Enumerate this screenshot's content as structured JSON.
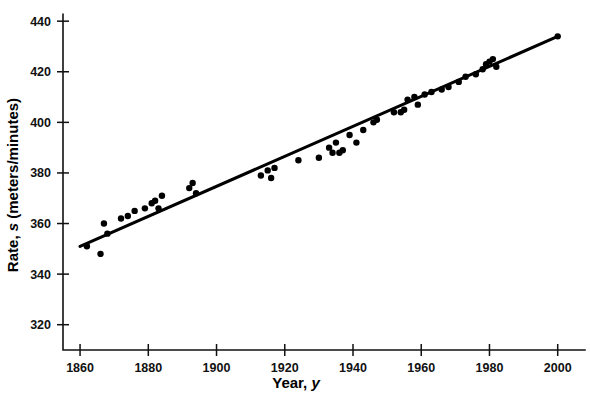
{
  "chart_data": {
    "type": "scatter",
    "title": "",
    "xlabel": "Year, y",
    "xlabel_plain": "Year,",
    "xlabel_italic": "y",
    "ylabel": "Rate, s (meters/minutes)",
    "ylabel_prefix": "Rate,",
    "ylabel_italic": "s",
    "ylabel_suffix": "(meters/minutes)",
    "xlim": [
      1855,
      2008
    ],
    "ylim": [
      310,
      446
    ],
    "xticks": [
      1860,
      1880,
      1900,
      1920,
      1940,
      1960,
      1980,
      2000
    ],
    "xticklabels": [
      "1860",
      "1880",
      "1900",
      "1920",
      "1940",
      "1960",
      "1980",
      "2000"
    ],
    "yticks": [
      320,
      340,
      360,
      380,
      400,
      420,
      440
    ],
    "yticklabels": [
      "320",
      "340",
      "360",
      "380",
      "400",
      "420",
      "440"
    ],
    "grid": false,
    "legend": null,
    "series": [
      {
        "name": "Winning rate",
        "marker": "filled-circle",
        "color": "#000000",
        "points": [
          [
            1862,
            351
          ],
          [
            1866,
            348
          ],
          [
            1867,
            360
          ],
          [
            1868,
            356
          ],
          [
            1872,
            362
          ],
          [
            1874,
            363
          ],
          [
            1876,
            365
          ],
          [
            1879,
            366
          ],
          [
            1881,
            368
          ],
          [
            1882,
            369
          ],
          [
            1883,
            366
          ],
          [
            1884,
            371
          ],
          [
            1892,
            374
          ],
          [
            1893,
            376
          ],
          [
            1894,
            372
          ],
          [
            1913,
            379
          ],
          [
            1915,
            381
          ],
          [
            1916,
            378
          ],
          [
            1917,
            382
          ],
          [
            1924,
            385
          ],
          [
            1930,
            386
          ],
          [
            1933,
            390
          ],
          [
            1934,
            388
          ],
          [
            1935,
            392
          ],
          [
            1936,
            388
          ],
          [
            1937,
            389
          ],
          [
            1939,
            395
          ],
          [
            1941,
            392
          ],
          [
            1943,
            397
          ],
          [
            1946,
            400
          ],
          [
            1947,
            401
          ],
          [
            1952,
            404
          ],
          [
            1954,
            404
          ],
          [
            1955,
            405
          ],
          [
            1956,
            409
          ],
          [
            1958,
            410
          ],
          [
            1959,
            407
          ],
          [
            1961,
            411
          ],
          [
            1963,
            412
          ],
          [
            1966,
            413
          ],
          [
            1968,
            414
          ],
          [
            1971,
            416
          ],
          [
            1973,
            418
          ],
          [
            1976,
            419
          ],
          [
            1978,
            421
          ],
          [
            1979,
            423
          ],
          [
            1980,
            424
          ],
          [
            1981,
            425
          ],
          [
            1982,
            422
          ],
          [
            2000,
            434
          ]
        ]
      }
    ],
    "fit_line": {
      "name": "Least-squares regression line",
      "color": "#000000",
      "endpoints": [
        [
          1860,
          351
        ],
        [
          2000,
          434
        ]
      ]
    }
  }
}
